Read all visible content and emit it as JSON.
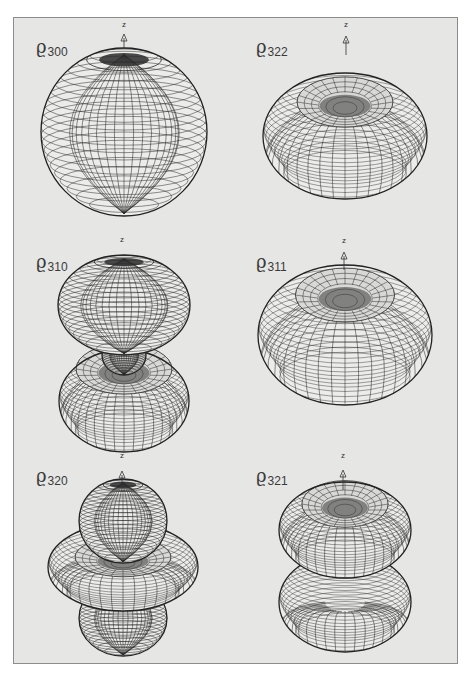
{
  "figure": {
    "background": "#e6e6e4",
    "border_color": "#8c8c8c",
    "line_color": "#2a2a2a",
    "surface_fill": "#ececea",
    "panels": [
      {
        "id": "rho-300",
        "label_symbol": "ϱ",
        "label_sub": "300",
        "axis_label": "z",
        "label_pos": [
          36,
          36
        ],
        "axis_pos": [
          124,
          20
        ],
        "arrow": [
          124,
          34,
          48
        ],
        "shapes": [
          {
            "type": "sphere",
            "cx": 124,
            "cy": 132,
            "rx": 83,
            "ry": 84,
            "top_dark": true
          }
        ]
      },
      {
        "id": "rho-322",
        "label_symbol": "ϱ",
        "label_sub": "322",
        "axis_label": "z",
        "label_pos": [
          256,
          36
        ],
        "axis_pos": [
          346,
          20
        ],
        "arrow": [
          346,
          36,
          55
        ],
        "shapes": [
          {
            "type": "torus",
            "cx": 345,
            "cy": 136,
            "rx": 82,
            "ry": 63,
            "hole_rx": 30,
            "hole_ry": 14,
            "hole_cy_off": -34
          }
        ]
      },
      {
        "id": "rho-310",
        "label_symbol": "ϱ",
        "label_sub": "310",
        "axis_label": "z",
        "label_pos": [
          36,
          251
        ],
        "axis_pos": [
          122,
          235
        ],
        "arrow": null,
        "shapes": [
          {
            "type": "torus",
            "cx": 124,
            "cy": 401,
            "rx": 65,
            "ry": 51,
            "hole_rx": 30,
            "hole_ry": 14,
            "hole_cy_off": -32
          },
          {
            "type": "sphere",
            "cx": 124,
            "cy": 355,
            "rx": 22,
            "ry": 20,
            "top_dark": false
          },
          {
            "type": "sphere",
            "cx": 124,
            "cy": 305,
            "rx": 66,
            "ry": 50,
            "top_dark": true
          }
        ]
      },
      {
        "id": "rho-311",
        "label_symbol": "ϱ",
        "label_sub": "311",
        "axis_label": "z",
        "label_pos": [
          256,
          251
        ],
        "axis_pos": [
          344,
          236
        ],
        "arrow": [
          344,
          252,
          270
        ],
        "shapes": [
          {
            "type": "torus",
            "cx": 345,
            "cy": 335,
            "rx": 87,
            "ry": 70,
            "hole_rx": 31,
            "hole_ry": 15,
            "hole_cy_off": -40
          }
        ]
      },
      {
        "id": "rho-320",
        "label_symbol": "ϱ",
        "label_sub": "320",
        "axis_label": "z",
        "label_pos": [
          36,
          465
        ],
        "axis_pos": [
          122,
          451
        ],
        "arrow": [
          122,
          471,
          482
        ],
        "shapes": [
          {
            "type": "sphere",
            "cx": 123,
            "cy": 618,
            "rx": 44,
            "ry": 38,
            "top_dark": false
          },
          {
            "type": "torus",
            "cx": 123,
            "cy": 567,
            "rx": 75,
            "ry": 44,
            "hole_rx": 30,
            "hole_ry": 11,
            "hole_cy_off": -10
          },
          {
            "type": "sphere",
            "cx": 123,
            "cy": 521,
            "rx": 44,
            "ry": 42,
            "top_dark": true
          }
        ]
      },
      {
        "id": "rho-321",
        "label_symbol": "ϱ",
        "label_sub": "321",
        "axis_label": "z",
        "label_pos": [
          256,
          465
        ],
        "axis_pos": [
          343,
          451
        ],
        "arrow": [
          343,
          470,
          490
        ],
        "shapes": [
          {
            "type": "torus",
            "cx": 345,
            "cy": 602,
            "rx": 66,
            "ry": 50,
            "hole_rx": 0,
            "hole_ry": 0,
            "hole_cy_off": 0
          },
          {
            "type": "torus",
            "cx": 345,
            "cy": 530,
            "rx": 66,
            "ry": 48,
            "hole_rx": 27,
            "hole_ry": 13,
            "hole_cy_off": -26
          }
        ]
      }
    ]
  }
}
